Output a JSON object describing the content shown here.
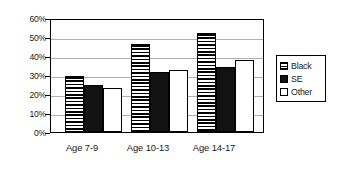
{
  "chart_data": {
    "type": "bar",
    "title": "",
    "subtitle": "",
    "xlabel": "",
    "ylabel": "",
    "categories": [
      "Age 7-9",
      "Age 10-13",
      "Age 14-17"
    ],
    "series": [
      {
        "name": "Black",
        "values": [
          30,
          47,
          53
        ],
        "fill": "horizontal-stripes"
      },
      {
        "name": "SE",
        "values": [
          25,
          32,
          35
        ],
        "fill": "solid-black"
      },
      {
        "name": "Other",
        "values": [
          23.5,
          33,
          38.5
        ],
        "fill": "white-outlined"
      }
    ],
    "ylim": [
      0,
      60
    ],
    "ytick_step": 10,
    "ytick_labels": [
      "0%",
      "10%",
      "20%",
      "30%",
      "40%",
      "50%",
      "60%"
    ],
    "ytick_values": [
      0,
      10,
      20,
      30,
      40,
      50,
      60
    ],
    "grid": true,
    "grid_axis": "y",
    "legend_position": "right",
    "annotations": [],
    "colors": {
      "axis": "#000000",
      "gridline": "#b0b0b0",
      "text": "#1a1a1a",
      "series_solid": "#121212",
      "series_open": "#ffffff",
      "background": "#ffffff"
    }
  },
  "legend": {
    "entries": [
      {
        "label": "Black"
      },
      {
        "label": "SE"
      },
      {
        "label": "Other"
      }
    ]
  }
}
